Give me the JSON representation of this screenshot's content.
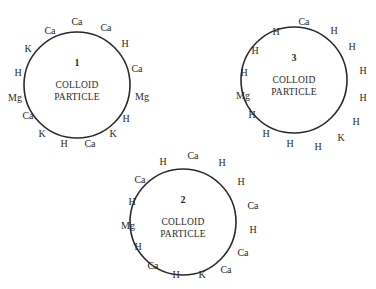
{
  "diagram": {
    "stroke_color": "#2a2a2a",
    "particles": [
      {
        "id": "1",
        "number": "1",
        "label_line1": "COLLOID",
        "label_line2": "PARTICLE",
        "center": [
          77,
          85
        ],
        "radius": 53,
        "ions": [
          {
            "text": "Ca",
            "x": 77,
            "y": 21
          },
          {
            "text": "Ca",
            "x": 106,
            "y": 27
          },
          {
            "text": "H",
            "x": 125,
            "y": 43
          },
          {
            "text": "Ca",
            "x": 137,
            "y": 68
          },
          {
            "text": "Mg",
            "x": 142,
            "y": 96
          },
          {
            "text": "H",
            "x": 126,
            "y": 118
          },
          {
            "text": "K",
            "x": 113,
            "y": 133
          },
          {
            "text": "Ca",
            "x": 90,
            "y": 143
          },
          {
            "text": "H",
            "x": 64,
            "y": 143
          },
          {
            "text": "K",
            "x": 42,
            "y": 133
          },
          {
            "text": "Ca",
            "x": 28,
            "y": 115
          },
          {
            "text": "Mg",
            "x": 15,
            "y": 97
          },
          {
            "text": "H",
            "x": 18,
            "y": 72
          },
          {
            "text": "K",
            "x": 28,
            "y": 48
          },
          {
            "text": "Ca",
            "x": 50,
            "y": 30
          }
        ]
      },
      {
        "id": "3",
        "number": "3",
        "label_line1": "COLLOID",
        "label_line2": "PARTICLE",
        "center": [
          294,
          80
        ],
        "radius": 53,
        "ions": [
          {
            "text": "Ca",
            "x": 304,
            "y": 21
          },
          {
            "text": "H",
            "x": 334,
            "y": 30
          },
          {
            "text": "H",
            "x": 352,
            "y": 46
          },
          {
            "text": "H",
            "x": 363,
            "y": 70
          },
          {
            "text": "H",
            "x": 363,
            "y": 97
          },
          {
            "text": "H",
            "x": 356,
            "y": 121
          },
          {
            "text": "K",
            "x": 341,
            "y": 137
          },
          {
            "text": "H",
            "x": 318,
            "y": 146
          },
          {
            "text": "H",
            "x": 290,
            "y": 143
          },
          {
            "text": "H",
            "x": 266,
            "y": 133
          },
          {
            "text": "H",
            "x": 252,
            "y": 114
          },
          {
            "text": "Mg",
            "x": 243,
            "y": 95
          },
          {
            "text": "H",
            "x": 244,
            "y": 72
          },
          {
            "text": "H",
            "x": 255,
            "y": 50
          },
          {
            "text": "H",
            "x": 276,
            "y": 31
          }
        ]
      },
      {
        "id": "2",
        "number": "2",
        "label_line1": "COLLOID",
        "label_line2": "PARTICLE",
        "center": [
          183,
          222
        ],
        "radius": 53,
        "ions": [
          {
            "text": "Ca",
            "x": 193,
            "y": 155
          },
          {
            "text": "H",
            "x": 222,
            "y": 162
          },
          {
            "text": "H",
            "x": 241,
            "y": 181
          },
          {
            "text": "Ca",
            "x": 253,
            "y": 205
          },
          {
            "text": "H",
            "x": 253,
            "y": 229
          },
          {
            "text": "Ca",
            "x": 243,
            "y": 252
          },
          {
            "text": "Ca",
            "x": 226,
            "y": 269
          },
          {
            "text": "K",
            "x": 202,
            "y": 274
          },
          {
            "text": "H",
            "x": 176,
            "y": 274
          },
          {
            "text": "Ca",
            "x": 153,
            "y": 265
          },
          {
            "text": "H",
            "x": 138,
            "y": 246
          },
          {
            "text": "Mg",
            "x": 128,
            "y": 225
          },
          {
            "text": "H",
            "x": 132,
            "y": 201
          },
          {
            "text": "Ca",
            "x": 140,
            "y": 179
          },
          {
            "text": "H",
            "x": 163,
            "y": 161
          }
        ]
      }
    ]
  }
}
